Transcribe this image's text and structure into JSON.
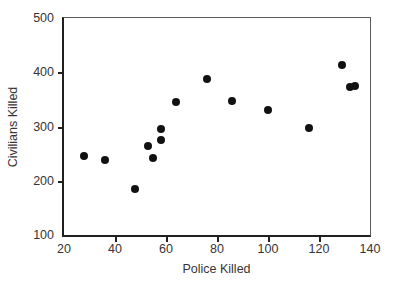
{
  "chart_data": {
    "type": "scatter",
    "title": "",
    "xlabel": "Police Killed",
    "ylabel": "Civilians Killed",
    "xlim": [
      20,
      140
    ],
    "ylim": [
      100,
      500
    ],
    "xticks": [
      20,
      40,
      60,
      80,
      100,
      120,
      140
    ],
    "yticks": [
      100,
      200,
      300,
      400,
      500
    ],
    "xtick_labels": [
      "20",
      "40",
      "60",
      "80",
      "100",
      "120",
      "140"
    ],
    "ytick_labels": [
      "100",
      "200",
      "300",
      "400",
      "500"
    ],
    "grid": false,
    "legend": null,
    "marker_color": "#111111",
    "axis_color": "#221f1f",
    "text_color": "#373435",
    "background": "#ffffff",
    "points": [
      {
        "x": 28,
        "y": 245
      },
      {
        "x": 36,
        "y": 238
      },
      {
        "x": 48,
        "y": 184
      },
      {
        "x": 53,
        "y": 264
      },
      {
        "x": 55,
        "y": 242
      },
      {
        "x": 58,
        "y": 295
      },
      {
        "x": 58,
        "y": 275
      },
      {
        "x": 64,
        "y": 345
      },
      {
        "x": 76,
        "y": 387
      },
      {
        "x": 86,
        "y": 347
      },
      {
        "x": 100,
        "y": 331
      },
      {
        "x": 116,
        "y": 298
      },
      {
        "x": 129,
        "y": 413
      },
      {
        "x": 132,
        "y": 373
      },
      {
        "x": 134,
        "y": 375
      }
    ]
  }
}
